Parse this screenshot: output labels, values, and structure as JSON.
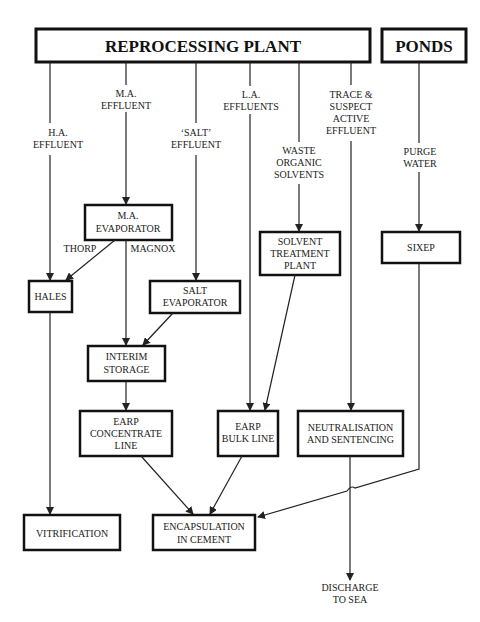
{
  "diagram": {
    "sources": {
      "reprocessing_plant": "REPROCESSING PLANT",
      "ponds": "PONDS"
    },
    "streams": {
      "ha_effluent": [
        "H.A.",
        "EFFLUENT"
      ],
      "ma_effluent": [
        "M.A.",
        "EFFLUENT"
      ],
      "salt_effluent": [
        "‘SALT’",
        "EFFLUENT"
      ],
      "la_effluents": [
        "L.A.",
        "EFFLUENTS"
      ],
      "waste_organic_solvents": [
        "WASTE",
        "ORGANIC",
        "SOLVENTS"
      ],
      "trace_suspect": [
        "TRACE &",
        "SUSPECT",
        "ACTIVE",
        "EFFLUENT"
      ],
      "purge_water": [
        "PURGE",
        "WATER"
      ],
      "thorp": "THORP",
      "magnox": "MAGNOX",
      "discharge": [
        "DISCHARGE",
        "TO SEA"
      ]
    },
    "nodes": {
      "ma_evaporator": [
        "M.A.",
        "EVAPORATOR"
      ],
      "hales": [
        "HALES"
      ],
      "salt_evaporator": [
        "SALT",
        "EVAPORATOR"
      ],
      "solvent_treatment": [
        "SOLVENT",
        "TREATMENT",
        "PLANT"
      ],
      "sixep": [
        "SIXEP"
      ],
      "interim_storage": [
        "INTERIM",
        "STORAGE"
      ],
      "earp_concentrate": [
        "EARP",
        "CONCENTRATE",
        "LINE"
      ],
      "earp_bulk": [
        "EARP",
        "BULK LINE"
      ],
      "neutralisation": [
        "NEUTRALISATION",
        "AND SENTENCING"
      ],
      "vitrification": [
        "VITRIFICATION"
      ],
      "encapsulation": [
        "ENCAPSULATION",
        "IN CEMENT"
      ]
    },
    "edges": [
      {
        "from": "reprocessing_plant",
        "to": "hales",
        "label": "H.A. EFFLUENT"
      },
      {
        "from": "reprocessing_plant",
        "to": "ma_evaporator",
        "label": "M.A. EFFLUENT"
      },
      {
        "from": "reprocessing_plant",
        "to": "salt_evaporator",
        "label": "'SALT' EFFLUENT"
      },
      {
        "from": "reprocessing_plant",
        "to": "earp_bulk",
        "label": "L.A. EFFLUENTS"
      },
      {
        "from": "reprocessing_plant",
        "to": "solvent_treatment",
        "label": "WASTE ORGANIC SOLVENTS"
      },
      {
        "from": "reprocessing_plant",
        "to": "neutralisation",
        "label": "TRACE & SUSPECT ACTIVE EFFLUENT"
      },
      {
        "from": "ponds",
        "to": "sixep",
        "label": "PURGE WATER"
      },
      {
        "from": "ma_evaporator",
        "to": "hales",
        "label": "THORP"
      },
      {
        "from": "ma_evaporator",
        "to": "interim_storage",
        "label": "MAGNOX"
      },
      {
        "from": "salt_evaporator",
        "to": "interim_storage"
      },
      {
        "from": "interim_storage",
        "to": "earp_concentrate"
      },
      {
        "from": "solvent_treatment",
        "to": "earp_bulk"
      },
      {
        "from": "hales",
        "to": "vitrification"
      },
      {
        "from": "earp_concentrate",
        "to": "encapsulation"
      },
      {
        "from": "earp_bulk",
        "to": "encapsulation"
      },
      {
        "from": "sixep",
        "to": "encapsulation"
      },
      {
        "from": "neutralisation",
        "to": "discharge",
        "label": "DISCHARGE TO SEA"
      }
    ]
  }
}
